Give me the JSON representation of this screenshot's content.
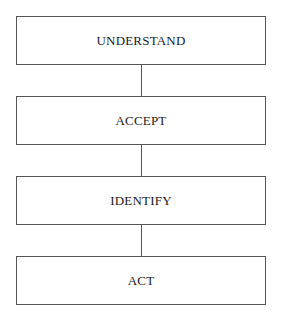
{
  "diagram": {
    "type": "vertical-flowchart",
    "steps": [
      {
        "label": "UNDERSTAND"
      },
      {
        "label": "ACCEPT"
      },
      {
        "label": "IDENTIFY"
      },
      {
        "label": "ACT"
      }
    ],
    "colors": {
      "border": "#555555",
      "text": "#1a1a1a",
      "background": "#ffffff"
    }
  }
}
